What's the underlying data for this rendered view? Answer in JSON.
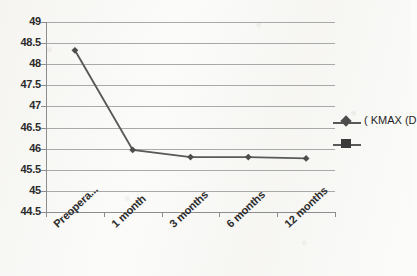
{
  "chart_data": {
    "type": "line",
    "title": "",
    "xlabel": "",
    "ylabel": "",
    "categories": [
      "Preopera...",
      "1 month",
      "3 months",
      "6 months",
      "12 months"
    ],
    "series": [
      {
        "name": "( KMAX (D",
        "marker": "diamond",
        "color": "#4d4d4d",
        "values": [
          48.33,
          45.97,
          45.8,
          45.8,
          45.77
        ]
      }
    ],
    "ylim": [
      44.5,
      49
    ],
    "ytick_step": 0.5,
    "yticks": [
      "49",
      "48.5",
      "48",
      "47.5",
      "47",
      "46.5",
      "46",
      "45.5",
      "45",
      "44.5"
    ],
    "ytick_values": [
      49,
      48.5,
      48,
      47.5,
      47,
      46.5,
      46,
      45.5,
      45,
      44.5
    ],
    "grid": true,
    "legend_position": "right"
  },
  "legend": {
    "entries": [
      {
        "label": "( KMAX (D",
        "marker": "diamond-line",
        "color": "#4d4d4d"
      },
      {
        "label": "",
        "marker": "square-line",
        "color": "#3a3a3a"
      }
    ]
  },
  "colors": {
    "series_line": "#595959",
    "series_marker": "#4d4d4d",
    "gridline": "#a9a9a9",
    "axis": "#8d8d8d",
    "text": "#2b2b2b",
    "background": "#fbfbf9"
  }
}
